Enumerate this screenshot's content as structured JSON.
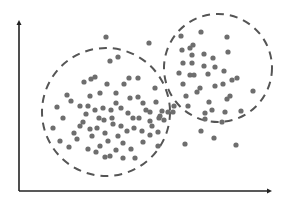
{
  "chart_data": {
    "type": "scatter",
    "title": "",
    "xlabel": "",
    "ylabel": "",
    "grid": false,
    "legend": "none",
    "axes": {
      "origin_px": [
        19,
        191
      ],
      "x_end_px": 272,
      "y_end_px": 20,
      "ticks": "none",
      "arrows": true,
      "color": "#222222"
    },
    "point_color": "#6e6e6e",
    "point_radius": 2.6,
    "clusters": [
      {
        "name": "cluster-left",
        "boundary": {
          "cx": 106,
          "cy": 112,
          "r": 64,
          "style": "dashed",
          "color": "#555555"
        },
        "points": [
          [
            110,
            61
          ],
          [
            118,
            57
          ],
          [
            95,
            77
          ],
          [
            91,
            79
          ],
          [
            84,
            82
          ],
          [
            107,
            84
          ],
          [
            129,
            78
          ],
          [
            138,
            78
          ],
          [
            57,
            107
          ],
          [
            63,
            118
          ],
          [
            67,
            95
          ],
          [
            100,
            93
          ],
          [
            116,
            93
          ],
          [
            90,
            96
          ],
          [
            71,
            101
          ],
          [
            116,
            103
          ],
          [
            80,
            106
          ],
          [
            88,
            106
          ],
          [
            95,
            110
          ],
          [
            103,
            108
          ],
          [
            111,
            110
          ],
          [
            86,
            114
          ],
          [
            99,
            118
          ],
          [
            112,
            118
          ],
          [
            121,
            108
          ],
          [
            130,
            98
          ],
          [
            138,
            97
          ],
          [
            143,
            103
          ],
          [
            146,
            110
          ],
          [
            128,
            113
          ],
          [
            133,
            118
          ],
          [
            139,
            118
          ],
          [
            104,
            120
          ],
          [
            113,
            124
          ],
          [
            121,
            126
          ],
          [
            83,
            122
          ],
          [
            80,
            126
          ],
          [
            74,
            133
          ],
          [
            77,
            139
          ],
          [
            90,
            129
          ],
          [
            97,
            128
          ],
          [
            105,
            133
          ],
          [
            92,
            136
          ],
          [
            100,
            146
          ],
          [
            108,
            141
          ],
          [
            118,
            136
          ],
          [
            127,
            131
          ],
          [
            134,
            128
          ],
          [
            142,
            131
          ],
          [
            152,
            126
          ],
          [
            150,
            112
          ],
          [
            159,
            118
          ],
          [
            162,
            111
          ],
          [
            156,
            102
          ],
          [
            150,
            121
          ],
          [
            123,
            143
          ],
          [
            131,
            149
          ],
          [
            143,
            142
          ],
          [
            150,
            135
          ],
          [
            158,
            132
          ],
          [
            164,
            120
          ],
          [
            60,
            141
          ],
          [
            69,
            147
          ],
          [
            88,
            149
          ],
          [
            105,
            157
          ],
          [
            96,
            152
          ],
          [
            116,
            150
          ],
          [
            110,
            156
          ],
          [
            123,
            158
          ],
          [
            135,
            158
          ],
          [
            53,
            128
          ],
          [
            124,
            84
          ],
          [
            158,
            146
          ]
        ]
      },
      {
        "name": "cluster-right",
        "boundary": {
          "cx": 218,
          "cy": 68,
          "r": 54,
          "style": "dashed",
          "color": "#555555"
        },
        "points": [
          [
            181,
            36
          ],
          [
            201,
            32
          ],
          [
            227,
            37
          ],
          [
            193,
            45
          ],
          [
            182,
            50
          ],
          [
            190,
            48
          ],
          [
            192,
            55
          ],
          [
            204,
            54
          ],
          [
            213,
            58
          ],
          [
            228,
            52
          ],
          [
            183,
            63
          ],
          [
            192,
            63
          ],
          [
            204,
            66
          ],
          [
            215,
            67
          ],
          [
            224,
            71
          ],
          [
            179,
            73
          ],
          [
            190,
            75
          ],
          [
            194,
            75
          ],
          [
            208,
            74
          ],
          [
            232,
            80
          ],
          [
            237,
            78
          ],
          [
            223,
            84
          ],
          [
            183,
            84
          ],
          [
            197,
            92
          ],
          [
            200,
            88
          ],
          [
            215,
            86
          ],
          [
            186,
            96
          ],
          [
            209,
            102
          ],
          [
            227,
            99
          ],
          [
            230,
            96
          ],
          [
            253,
            91
          ],
          [
            212,
            110
          ],
          [
            188,
            106
          ],
          [
            205,
            113
          ],
          [
            241,
            111
          ],
          [
            225,
            112
          ],
          [
            205,
            119
          ],
          [
            222,
            122
          ],
          [
            173,
            112
          ]
        ]
      }
    ],
    "outliers": [
      [
        106,
        37
      ],
      [
        149,
        43
      ],
      [
        185,
        144
      ],
      [
        201,
        131
      ],
      [
        214,
        138
      ],
      [
        236,
        145
      ],
      [
        168,
        112
      ],
      [
        174,
        106
      ],
      [
        160,
        116
      ],
      [
        155,
        88
      ]
    ]
  }
}
